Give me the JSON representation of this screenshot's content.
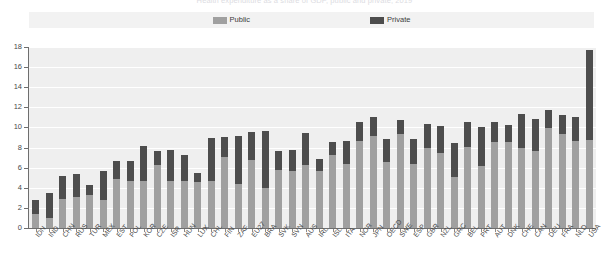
{
  "title": "Health expenditure as a share of GDP, public and private, 2019",
  "legend": {
    "position": "top",
    "items": [
      {
        "label": "Public",
        "color": "#a0a0a0",
        "name": "legend-public"
      },
      {
        "label": "Private",
        "color": "#4d4d4d",
        "name": "legend-private"
      }
    ]
  },
  "axis": {
    "y_ticks": [
      "0",
      "2",
      "4",
      "6",
      "8",
      "10",
      "12",
      "14",
      "16",
      "18"
    ],
    "y_min": 0,
    "y_max": 18
  },
  "chart_data": {
    "type": "bar",
    "subtype": "stacked-column",
    "title": "Health expenditure as a share of GDP, public and private, 2019",
    "xlabel": "",
    "ylabel": "",
    "ylim": [
      0,
      18
    ],
    "ytick_step": 2,
    "grid": true,
    "legend_position": "top",
    "categories": [
      "IDN",
      "IND",
      "CHN",
      "RUS",
      "TUR",
      "MEX",
      "EST",
      "POL",
      "KOR",
      "CZE",
      "ISR",
      "HUN",
      "LUX",
      "CHL",
      "FIN",
      "ZAF",
      "EU27",
      "BRA",
      "SVK",
      "SVN",
      "AUS",
      "IRL",
      "ISL",
      "ITA",
      "NOR",
      "JPN",
      "OECD",
      "SWE",
      "ESP",
      "GBR",
      "NZL",
      "GRC",
      "BEL",
      "PRT",
      "AUT",
      "DNK",
      "CHE",
      "CAN",
      "DEU",
      "FRA",
      "NLD",
      "USA"
    ],
    "series": [
      {
        "name": "Public",
        "color": "#a0a0a0",
        "values": [
          1.4,
          1.0,
          2.9,
          3.1,
          3.3,
          2.8,
          4.9,
          4.7,
          4.7,
          6.3,
          4.7,
          4.7,
          4.6,
          4.7,
          7.1,
          4.4,
          6.8,
          4.0,
          5.8,
          5.7,
          6.3,
          5.7,
          7.3,
          6.4,
          8.7,
          9.2,
          6.6,
          9.3,
          6.4,
          8.0,
          7.5,
          5.1,
          8.1,
          6.2,
          8.6,
          8.6,
          8.0,
          7.7,
          9.9,
          9.3,
          8.7,
          8.8
        ]
      },
      {
        "name": "Private",
        "color": "#4d4d4d",
        "values": [
          1.4,
          2.5,
          2.3,
          2.3,
          1.0,
          2.9,
          1.8,
          2.0,
          3.5,
          1.4,
          3.1,
          2.6,
          0.9,
          4.3,
          2.0,
          4.8,
          2.7,
          5.6,
          1.9,
          2.1,
          3.1,
          1.2,
          1.3,
          2.3,
          1.8,
          1.8,
          2.3,
          1.4,
          2.5,
          2.3,
          2.6,
          3.4,
          2.4,
          3.8,
          1.9,
          1.6,
          3.3,
          3.1,
          1.8,
          1.9,
          2.3,
          8.9
        ]
      }
    ]
  }
}
